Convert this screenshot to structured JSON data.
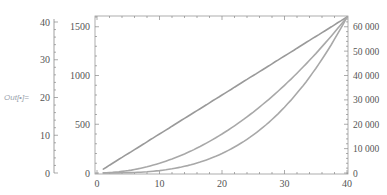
{
  "cell": {
    "out_label": "Out[•]="
  },
  "colors": {
    "axis": "#888888",
    "series": "#a0a0a0",
    "frame": "#999999"
  },
  "chart_data": {
    "type": "line",
    "title": "",
    "xlabel": "",
    "ylabel": "",
    "grid": false,
    "legend": "none",
    "x": [
      1,
      5,
      10,
      15,
      20,
      25,
      30,
      35,
      40
    ],
    "xlim": [
      0,
      40
    ],
    "x_ticks": [
      "0",
      "10",
      "20",
      "30",
      "40"
    ],
    "outer_left_axis": {
      "ticks": [
        "0",
        "10",
        "20",
        "30",
        "40"
      ],
      "range": [
        0,
        40
      ]
    },
    "inner_left_axis": {
      "ticks": [
        "0",
        "500",
        "1000",
        "1500"
      ],
      "range": [
        0,
        1600
      ]
    },
    "right_axis": {
      "ticks": [
        "0",
        "10 000",
        "20 000",
        "30 000",
        "40 000",
        "50 000",
        "60 000"
      ],
      "range": [
        0,
        64000
      ]
    },
    "series": [
      {
        "name": "n (outer left axis, 0-40)",
        "values": [
          1,
          5,
          10,
          15,
          20,
          25,
          30,
          35,
          40
        ]
      },
      {
        "name": "n^2 (inner left axis, 0-1600)",
        "values": [
          1,
          25,
          100,
          225,
          400,
          625,
          900,
          1225,
          1600
        ]
      },
      {
        "name": "n^3 (right axis, 0-64000)",
        "values": [
          1,
          125,
          1000,
          3375,
          8000,
          15625,
          27000,
          42875,
          64000
        ]
      }
    ]
  }
}
